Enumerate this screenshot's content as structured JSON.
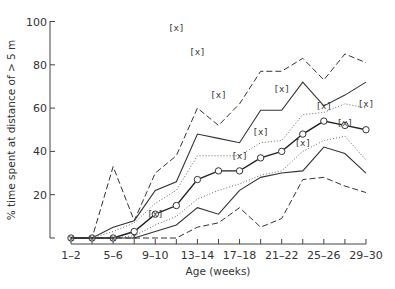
{
  "chart_data": {
    "type": "line",
    "title": "",
    "xlabel": "Age (weeks)",
    "ylabel": "% time spent at distance of > 5 m",
    "ylim": [
      0,
      100
    ],
    "yticks": [
      20,
      40,
      60,
      80,
      100
    ],
    "categories": [
      "1-2",
      "3-4",
      "5-6",
      "7-8",
      "9-10",
      "11-12",
      "13-14",
      "15-16",
      "17-18",
      "19-20",
      "21-22",
      "23-24",
      "25-26",
      "27-28",
      "29-30"
    ],
    "xtick_labels_shown": [
      "1-2",
      "5-6",
      "9-10",
      "13-14",
      "17-18",
      "21-22",
      "25-26",
      "29-30"
    ],
    "grid": false,
    "legend": null,
    "series": [
      {
        "name": "upper dashed (max)",
        "style": "dashed",
        "values": [
          0,
          0,
          33,
          8,
          30,
          38,
          60,
          52,
          62,
          77,
          77,
          83,
          73,
          85,
          81
        ]
      },
      {
        "name": "upper solid",
        "style": "solid",
        "values": [
          0,
          0,
          5,
          8,
          22,
          26,
          48,
          46,
          44,
          59,
          59,
          72,
          61,
          66,
          72
        ]
      },
      {
        "name": "upper dotted",
        "style": "dotted",
        "values": [
          0,
          0,
          3,
          7,
          16,
          22,
          38,
          38,
          38,
          44,
          45,
          57,
          58,
          62,
          60
        ]
      },
      {
        "name": "median",
        "style": "solid-circles",
        "values": [
          0,
          0,
          0,
          3,
          11,
          15,
          27,
          31,
          31,
          37,
          40,
          48,
          54,
          52,
          50
        ]
      },
      {
        "name": "lower dotted",
        "style": "dotted",
        "values": [
          0,
          0,
          0,
          1,
          6,
          10,
          18,
          22,
          25,
          29,
          31,
          40,
          45,
          47,
          36
        ]
      },
      {
        "name": "lower solid",
        "style": "solid",
        "values": [
          0,
          0,
          0,
          0,
          3,
          6,
          14,
          11,
          22,
          28,
          30,
          31,
          42,
          39,
          30
        ]
      },
      {
        "name": "lower dashed (min)",
        "style": "dashed",
        "values": [
          0,
          0,
          0,
          0,
          0,
          0,
          5,
          7,
          14,
          5,
          9,
          27,
          28,
          24,
          21
        ]
      }
    ],
    "markers_x": {
      "label": "[x]",
      "points": [
        {
          "x": "1-2",
          "y": 0
        },
        {
          "x": "3-4",
          "y": 0
        },
        {
          "x": "5-6",
          "y": 0
        },
        {
          "x": "7-8",
          "y": 1
        },
        {
          "x": "9-10",
          "y": 11
        },
        {
          "x": "11-12",
          "y": 97
        },
        {
          "x": "13-14",
          "y": 86
        },
        {
          "x": "15-16",
          "y": 66
        },
        {
          "x": "17-18",
          "y": 38
        },
        {
          "x": "19-20",
          "y": 49
        },
        {
          "x": "21-22",
          "y": 69
        },
        {
          "x": "23-24",
          "y": 44
        },
        {
          "x": "25-26",
          "y": 61
        },
        {
          "x": "27-28",
          "y": 53
        },
        {
          "x": "29-30",
          "y": 62
        }
      ]
    }
  },
  "labels": {
    "ylabel": "% time spent at distance of > 5 m",
    "xlabel": "Age (weeks)",
    "marker": "[x]"
  }
}
